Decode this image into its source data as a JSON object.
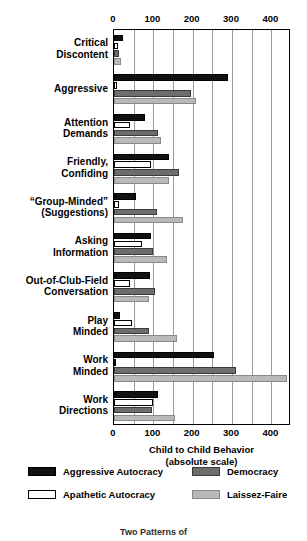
{
  "chart_data": {
    "type": "bar",
    "orientation": "horizontal",
    "title": "",
    "xlabel": "Child to Child Behavior",
    "xlabel_sub": "(absolute scale)",
    "ylabel": "",
    "xlim": [
      0,
      450
    ],
    "xticks": [
      0,
      100,
      200,
      300,
      400
    ],
    "xtick_labels": [
      "0",
      "100",
      "200",
      "300",
      "400"
    ],
    "gridlines": [
      50,
      100,
      150,
      200,
      250,
      300,
      350,
      400
    ],
    "grid": true,
    "legend_position": "bottom",
    "categories": [
      "Critical Discontent",
      "Aggressive",
      "Attention Demands",
      "Friendly, Confiding",
      "“Group-Minded” (Suggestions)",
      "Asking Information",
      "Out-of-Club-Field Conversation",
      "Play Minded",
      "Work Minded",
      "Work Directions"
    ],
    "category_lines": [
      [
        "Critical",
        "Discontent"
      ],
      [
        "Aggressive"
      ],
      [
        "Attention",
        "Demands"
      ],
      [
        "Friendly,",
        "Confiding"
      ],
      [
        "“Group-Minded”",
        "(Suggestions)"
      ],
      [
        "Asking",
        "Information"
      ],
      [
        "Out-of-Club-Field",
        "Conversation"
      ],
      [
        "Play",
        "Minded"
      ],
      [
        "Work",
        "Minded"
      ],
      [
        "Work",
        "Directions"
      ]
    ],
    "series": [
      {
        "name": "Aggressive Autocracy",
        "color": "#111111",
        "values": [
          22,
          290,
          78,
          140,
          55,
          93,
          92,
          16,
          255,
          113
        ]
      },
      {
        "name": "Apathetic Autocracy",
        "color": "#ffffff",
        "values": [
          10,
          8,
          40,
          95,
          12,
          70,
          40,
          46,
          6,
          100
        ]
      },
      {
        "name": "Democracy",
        "color": "#6d6d6d",
        "values": [
          13,
          196,
          113,
          165,
          110,
          100,
          105,
          90,
          310,
          96
        ]
      },
      {
        "name": "Laissez-Faire",
        "color": "#b9b9b9",
        "values": [
          18,
          208,
          120,
          140,
          175,
          136,
          88,
          160,
          440,
          155
        ]
      }
    ]
  },
  "legend": {
    "items": [
      {
        "label": "Aggressive Autocracy",
        "swatch": "black-swatch"
      },
      {
        "label": "Apathetic Autocracy",
        "swatch": "white-swatch"
      },
      {
        "label": "Democracy",
        "swatch": "dark-gray-swatch"
      },
      {
        "label": "Laissez-Faire",
        "swatch": "light-gray-swatch"
      }
    ]
  },
  "footer": {
    "note": "Two Patterns of"
  }
}
